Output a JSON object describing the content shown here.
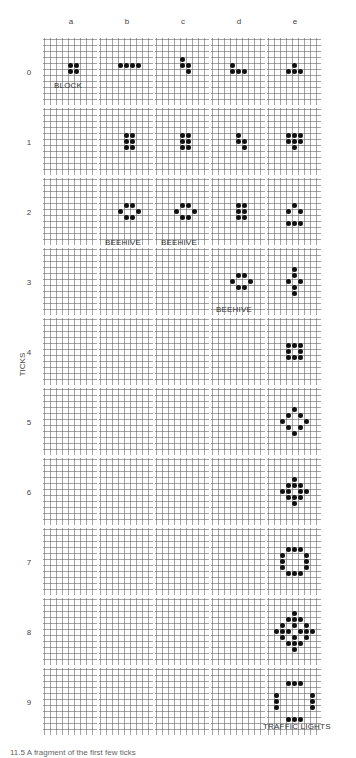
{
  "diagram": {
    "columns": [
      "a",
      "b",
      "c",
      "d",
      "e"
    ],
    "rows": [
      "0",
      "1",
      "2",
      "3",
      "4",
      "5",
      "6",
      "7",
      "8",
      "9"
    ],
    "axis_title": "TICKS",
    "cell_labels": [
      {
        "row": 0,
        "col": 0,
        "text": "BLOCK"
      },
      {
        "row": 2,
        "col": 1,
        "text": "BEEHIVE"
      },
      {
        "row": 2,
        "col": 2,
        "text": "BEEHIVE"
      },
      {
        "row": 3,
        "col": 3,
        "text": "BEEHIVE"
      },
      {
        "row": 9,
        "col": 4,
        "text": "TRAFFIC LIGHTS"
      }
    ],
    "patterns": [
      {
        "row": 0,
        "col": 0,
        "cells": [
          [
            0,
            0
          ],
          [
            1,
            0
          ],
          [
            0,
            1
          ],
          [
            1,
            1
          ]
        ]
      },
      {
        "row": 0,
        "col": 1,
        "cells": [
          [
            0,
            0
          ],
          [
            1,
            0
          ],
          [
            2,
            0
          ],
          [
            3,
            0
          ]
        ]
      },
      {
        "row": 0,
        "col": 2,
        "cells": [
          [
            0,
            0
          ],
          [
            0,
            1
          ],
          [
            1,
            1
          ],
          [
            1,
            2
          ]
        ]
      },
      {
        "row": 0,
        "col": 3,
        "cells": [
          [
            0,
            0
          ],
          [
            0,
            1
          ],
          [
            1,
            1
          ],
          [
            2,
            1
          ]
        ]
      },
      {
        "row": 0,
        "col": 4,
        "cells": [
          [
            1,
            0
          ],
          [
            0,
            1
          ],
          [
            1,
            1
          ],
          [
            2,
            1
          ]
        ]
      },
      {
        "row": 1,
        "col": 1,
        "cells": [
          [
            0,
            0
          ],
          [
            1,
            0
          ],
          [
            0,
            1
          ],
          [
            1,
            1
          ],
          [
            0,
            2
          ],
          [
            1,
            2
          ]
        ]
      },
      {
        "row": 1,
        "col": 2,
        "cells": [
          [
            0,
            0
          ],
          [
            1,
            0
          ],
          [
            0,
            1
          ],
          [
            1,
            1
          ],
          [
            0,
            2
          ],
          [
            1,
            2
          ]
        ]
      },
      {
        "row": 1,
        "col": 3,
        "cells": [
          [
            0,
            0
          ],
          [
            0,
            1
          ],
          [
            1,
            1
          ],
          [
            1,
            2
          ]
        ]
      },
      {
        "row": 1,
        "col": 4,
        "cells": [
          [
            0,
            0
          ],
          [
            1,
            0
          ],
          [
            2,
            0
          ],
          [
            0,
            1
          ],
          [
            1,
            1
          ],
          [
            2,
            1
          ],
          [
            1,
            2
          ]
        ]
      },
      {
        "row": 2,
        "col": 1,
        "cells": [
          [
            1,
            0
          ],
          [
            2,
            0
          ],
          [
            0,
            1
          ],
          [
            3,
            1
          ],
          [
            1,
            2
          ],
          [
            2,
            2
          ]
        ]
      },
      {
        "row": 2,
        "col": 2,
        "cells": [
          [
            1,
            0
          ],
          [
            2,
            0
          ],
          [
            0,
            1
          ],
          [
            3,
            1
          ],
          [
            1,
            2
          ],
          [
            2,
            2
          ]
        ]
      },
      {
        "row": 2,
        "col": 3,
        "cells": [
          [
            0,
            0
          ],
          [
            1,
            0
          ],
          [
            0,
            1
          ],
          [
            1,
            1
          ],
          [
            0,
            2
          ],
          [
            1,
            2
          ]
        ]
      },
      {
        "row": 2,
        "col": 4,
        "cells": [
          [
            1,
            0
          ],
          [
            0,
            1
          ],
          [
            2,
            1
          ],
          [
            0,
            3
          ],
          [
            1,
            3
          ],
          [
            2,
            3
          ]
        ]
      },
      {
        "row": 3,
        "col": 3,
        "cells": [
          [
            1,
            0
          ],
          [
            2,
            0
          ],
          [
            0,
            1
          ],
          [
            3,
            1
          ],
          [
            1,
            2
          ],
          [
            2,
            2
          ]
        ]
      },
      {
        "row": 3,
        "col": 4,
        "cells": [
          [
            1,
            0
          ],
          [
            1,
            1
          ],
          [
            0,
            2
          ],
          [
            2,
            2
          ],
          [
            1,
            3
          ],
          [
            1,
            4
          ]
        ]
      },
      {
        "row": 4,
        "col": 4,
        "cells": [
          [
            0,
            0
          ],
          [
            1,
            0
          ],
          [
            2,
            0
          ],
          [
            0,
            1
          ],
          [
            2,
            1
          ],
          [
            0,
            2
          ],
          [
            1,
            2
          ],
          [
            2,
            2
          ]
        ]
      },
      {
        "row": 5,
        "col": 4,
        "cells": [
          [
            2,
            0
          ],
          [
            1,
            1
          ],
          [
            3,
            1
          ],
          [
            0,
            2
          ],
          [
            4,
            2
          ],
          [
            1,
            3
          ],
          [
            3,
            3
          ],
          [
            2,
            4
          ]
        ]
      },
      {
        "row": 6,
        "col": 4,
        "cells": [
          [
            2,
            0
          ],
          [
            1,
            1
          ],
          [
            2,
            1
          ],
          [
            3,
            1
          ],
          [
            0,
            2
          ],
          [
            1,
            2
          ],
          [
            3,
            2
          ],
          [
            4,
            2
          ],
          [
            1,
            3
          ],
          [
            2,
            3
          ],
          [
            3,
            3
          ],
          [
            2,
            4
          ]
        ]
      },
      {
        "row": 7,
        "col": 4,
        "cells": [
          [
            1,
            0
          ],
          [
            2,
            0
          ],
          [
            3,
            0
          ],
          [
            0,
            1
          ],
          [
            4,
            1
          ],
          [
            0,
            2
          ],
          [
            4,
            2
          ],
          [
            0,
            3
          ],
          [
            4,
            3
          ],
          [
            1,
            4
          ],
          [
            2,
            4
          ],
          [
            3,
            4
          ]
        ]
      },
      {
        "row": 8,
        "col": 4,
        "cells": [
          [
            3,
            0
          ],
          [
            2,
            1
          ],
          [
            3,
            1
          ],
          [
            4,
            1
          ],
          [
            1,
            2
          ],
          [
            3,
            2
          ],
          [
            5,
            2
          ],
          [
            0,
            3
          ],
          [
            1,
            3
          ],
          [
            2,
            3
          ],
          [
            4,
            3
          ],
          [
            5,
            3
          ],
          [
            6,
            3
          ],
          [
            1,
            4
          ],
          [
            3,
            4
          ],
          [
            5,
            4
          ],
          [
            2,
            5
          ],
          [
            3,
            5
          ],
          [
            4,
            5
          ],
          [
            3,
            6
          ]
        ]
      },
      {
        "row": 9,
        "col": 4,
        "cells": [
          [
            2,
            0
          ],
          [
            3,
            0
          ],
          [
            4,
            0
          ],
          [
            0,
            2
          ],
          [
            6,
            2
          ],
          [
            0,
            3
          ],
          [
            6,
            3
          ],
          [
            0,
            4
          ],
          [
            6,
            4
          ],
          [
            2,
            6
          ],
          [
            3,
            6
          ],
          [
            4,
            6
          ]
        ]
      }
    ],
    "caption": "11.5 A fragment of the first few ticks"
  }
}
